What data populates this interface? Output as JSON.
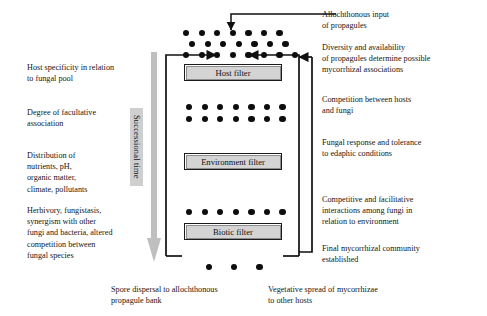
{
  "diagram": {
    "title_text": "",
    "type": "flow-filter-diagram",
    "colors": {
      "dot": "#0d0d0d",
      "filter_fill": "#d4d4d4",
      "filter_border": "#1b1b1b",
      "succ_label_fill": "#cfcfcf",
      "succ_arrow": "#b8b8b8",
      "wire": "#101010",
      "background": "#ffffff",
      "text": "#161616"
    }
  },
  "filters": [
    {
      "id": "host-filter",
      "label": "Host filter"
    },
    {
      "id": "environment-filter",
      "label": "Environment filter"
    },
    {
      "id": "biotic-filter",
      "label": "Biotic filter"
    }
  ],
  "successional_time": {
    "label": "Successional time",
    "direction": "downward"
  },
  "dot_rows": [
    {
      "id": "row-top-1",
      "count": 7,
      "above": "host-filter"
    },
    {
      "id": "row-top-2",
      "count": 7,
      "above": "host-filter"
    },
    {
      "id": "row-top-3",
      "count": 8,
      "above": "host-filter"
    },
    {
      "id": "row-mid-1",
      "count": 7,
      "above": "environment-filter"
    },
    {
      "id": "row-mid-2",
      "count": 7,
      "above": "environment-filter"
    },
    {
      "id": "row-biotic-1",
      "count": 7,
      "above": "biotic-filter"
    },
    {
      "id": "row-bottom",
      "count": 3,
      "above": "none"
    }
  ],
  "left_notes": [
    {
      "id": "note-host-specificity",
      "text": "Host specificity in relation\nto fungal pool"
    },
    {
      "id": "note-facultative",
      "text": "Degree of facultative\nassociation"
    },
    {
      "id": "note-distribution",
      "text": "Distribution of\nnutrients, pH,\norganic matter,\nclimate, pollutants"
    },
    {
      "id": "note-herbivory",
      "text": "Herbivory, fungistasis,\nsynergism with other\nfungi and bacteria, altered\ncompetition between\nfungal species"
    }
  ],
  "right_notes": [
    {
      "id": "note-allochthonous-input",
      "text": "Allochthonous input\nof propagules"
    },
    {
      "id": "note-diversity",
      "text": "Diversity and availability\nof propagules determine possible\nmycorrhizal associations"
    },
    {
      "id": "note-competition",
      "text": "Competition between hosts\nand fungi"
    },
    {
      "id": "note-fungal-response",
      "text": "Fungal response and tolerance\nto edaphic conditions"
    },
    {
      "id": "note-competitive-facilitative",
      "text": "Competitive and facilitative\ninteractions among fungi in\nrelation to environment"
    },
    {
      "id": "note-final-community",
      "text": "Final mycorrhizal community\nestablished"
    }
  ],
  "bottom_notes": [
    {
      "id": "note-spore-dispersal",
      "text": "Spore dispersal to allochthonous\npropagule bank"
    },
    {
      "id": "note-vegetative-spread",
      "text": "Vegetative spread of mycorrhizae\nto other hosts"
    }
  ]
}
